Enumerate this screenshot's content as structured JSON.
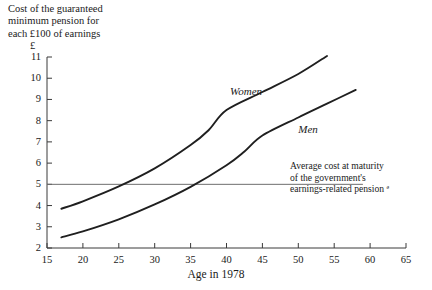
{
  "chart_data": {
    "type": "line",
    "title": "Cost of the guaranteed\nminimum pension for\neach £100 of earnings",
    "xlabel": "Age in 1978",
    "ylabel": "£",
    "xlim": [
      15,
      65
    ],
    "ylim": [
      2,
      11
    ],
    "grid": false,
    "legend_position": "inline-annotations",
    "x_ticks": [
      15,
      20,
      25,
      30,
      35,
      40,
      45,
      50,
      55,
      60,
      65
    ],
    "y_ticks": [
      2,
      3,
      4,
      5,
      6,
      7,
      8,
      9,
      10,
      11
    ],
    "series": [
      {
        "name": "Women",
        "label": "Women",
        "label_x": 40.5,
        "label_y": 9.35,
        "points": [
          {
            "x": 17.0,
            "y": 3.85
          },
          {
            "x": 20.0,
            "y": 4.2
          },
          {
            "x": 25.0,
            "y": 4.9
          },
          {
            "x": 30.0,
            "y": 5.75
          },
          {
            "x": 35.0,
            "y": 6.85
          },
          {
            "x": 37.5,
            "y": 7.55
          },
          {
            "x": 40.0,
            "y": 8.5
          },
          {
            "x": 45.0,
            "y": 9.35
          },
          {
            "x": 50.0,
            "y": 10.2
          },
          {
            "x": 54.0,
            "y": 11.05
          }
        ]
      },
      {
        "name": "Men",
        "label": "Men",
        "label_x": 50.0,
        "label_y": 7.55,
        "points": [
          {
            "x": 17.0,
            "y": 2.5
          },
          {
            "x": 20.0,
            "y": 2.78
          },
          {
            "x": 25.0,
            "y": 3.35
          },
          {
            "x": 30.0,
            "y": 4.05
          },
          {
            "x": 35.0,
            "y": 4.88
          },
          {
            "x": 40.0,
            "y": 5.9
          },
          {
            "x": 42.5,
            "y": 6.55
          },
          {
            "x": 45.0,
            "y": 7.3
          },
          {
            "x": 50.0,
            "y": 8.15
          },
          {
            "x": 54.0,
            "y": 8.8
          },
          {
            "x": 58.0,
            "y": 9.45
          }
        ]
      }
    ],
    "reference_line": {
      "name": "Average cost at maturity",
      "value": 5.0,
      "x_start": 15,
      "x_end": 59,
      "annotation": "Average cost at maturity\nof the government's\nearnings-related pension ª"
    }
  },
  "colors": {
    "axis": "#3a3a3a",
    "series_line": "#1f1f1f",
    "reference_line": "#6e6e6e",
    "text": "#1a1a1a",
    "background": "#ffffff"
  }
}
